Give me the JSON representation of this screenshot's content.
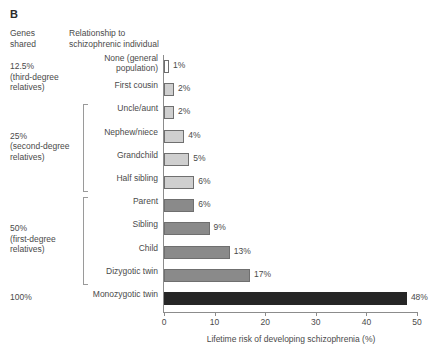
{
  "panel": {
    "letter": "B"
  },
  "headers": {
    "genes_shared": "Genes\nshared",
    "relationship": "Relationship to\nschizophrenic individual"
  },
  "groups": [
    {
      "id": "third-degree",
      "label": "12.5%\n(third-degree\nrelatives)",
      "bracket": false,
      "rows": [
        0,
        1
      ]
    },
    {
      "id": "second-degree",
      "label": "25%\n(second-degree\nrelatives)",
      "bracket": true,
      "rows": [
        2,
        3,
        4,
        5
      ]
    },
    {
      "id": "first-degree",
      "label": "50%\n(first-degree\nrelatives)",
      "bracket": true,
      "rows": [
        6,
        7,
        8,
        9
      ]
    },
    {
      "id": "identical",
      "label": "100%",
      "bracket": false,
      "rows": [
        10
      ]
    }
  ],
  "axis": {
    "ticks": [
      "0",
      "10",
      "20",
      "30",
      "40",
      "50"
    ],
    "xlabel": "Lifetime risk of developing schizophrenia (%)",
    "xmin": 0,
    "xmax": 50
  },
  "colors": {
    "bar_none": "#ffffff",
    "bar_light": "#cfcfcf",
    "bar_medium": "#8a8a8a",
    "bar_dark": "#262626",
    "outline": "#6f6f6f",
    "axis": "#8c8c8c",
    "text": "#4a4a4a"
  },
  "chart_data": {
    "type": "bar",
    "orientation": "horizontal",
    "title": "",
    "xlabel": "Lifetime risk of developing schizophrenia (%)",
    "ylabel": "",
    "xlim": [
      0,
      50
    ],
    "xticks": [
      0,
      10,
      20,
      30,
      40,
      50
    ],
    "grid": false,
    "legend": null,
    "categories": [
      "None (general population)",
      "First cousin",
      "Uncle/aunt",
      "Nephew/niece",
      "Grandchild",
      "Half sibling",
      "Parent",
      "Sibling",
      "Child",
      "Dizygotic twin",
      "Monozygotic twin"
    ],
    "values": [
      1,
      2,
      2,
      4,
      5,
      6,
      6,
      9,
      13,
      17,
      48
    ],
    "data_labels": [
      "1%",
      "2%",
      "2%",
      "4%",
      "5%",
      "6%",
      "6%",
      "9%",
      "13%",
      "17%",
      "48%"
    ],
    "bar_shades": [
      "none",
      "light",
      "light",
      "light",
      "light",
      "light",
      "medium",
      "medium",
      "medium",
      "medium",
      "dark"
    ],
    "genes_shared_group": [
      "12.5% (third-degree relatives)",
      "12.5% (third-degree relatives)",
      "25% (second-degree relatives)",
      "25% (second-degree relatives)",
      "25% (second-degree relatives)",
      "25% (second-degree relatives)",
      "50% (first-degree relatives)",
      "50% (first-degree relatives)",
      "50% (first-degree relatives)",
      "50% (first-degree relatives)",
      "100%"
    ]
  },
  "rows": [
    {
      "label": "None (general\npopulation)",
      "value": 1,
      "value_label": "1%",
      "shade": "none"
    },
    {
      "label": "First cousin",
      "value": 2,
      "value_label": "2%",
      "shade": "light"
    },
    {
      "label": "Uncle/aunt",
      "value": 2,
      "value_label": "2%",
      "shade": "light"
    },
    {
      "label": "Nephew/niece",
      "value": 4,
      "value_label": "4%",
      "shade": "light"
    },
    {
      "label": "Grandchild",
      "value": 5,
      "value_label": "5%",
      "shade": "light"
    },
    {
      "label": "Half sibling",
      "value": 6,
      "value_label": "6%",
      "shade": "light"
    },
    {
      "label": "Parent",
      "value": 6,
      "value_label": "6%",
      "shade": "medium"
    },
    {
      "label": "Sibling",
      "value": 9,
      "value_label": "9%",
      "shade": "medium"
    },
    {
      "label": "Child",
      "value": 13,
      "value_label": "13%",
      "shade": "medium"
    },
    {
      "label": "Dizygotic twin",
      "value": 17,
      "value_label": "17%",
      "shade": "medium"
    },
    {
      "label": "Monozygotic twin",
      "value": 48,
      "value_label": "48%",
      "shade": "dark"
    }
  ]
}
